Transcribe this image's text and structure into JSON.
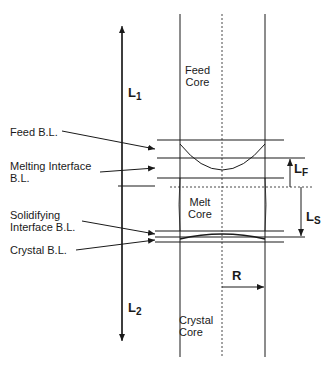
{
  "diagram": {
    "type": "schematic",
    "region_labels": {
      "feed_core": [
        "Feed",
        "Core"
      ],
      "melt_core": [
        "Melt",
        "Core"
      ],
      "crystal_core": [
        "Crystal",
        "Core"
      ]
    },
    "callouts": {
      "feed_bl": "Feed B.L.",
      "melting_interface_bl": [
        "Melting Interface",
        "B.L."
      ],
      "solidifying_interface_bl": [
        "Solidifying",
        "Interface B.L."
      ],
      "crystal_bl": "Crystal B.L."
    },
    "dimensions": {
      "l1": {
        "main": "L",
        "sub": "1"
      },
      "l2": {
        "main": "L",
        "sub": "2"
      },
      "lf": {
        "main": "L",
        "sub": "F"
      },
      "ls": {
        "main": "L",
        "sub": "S"
      },
      "r": "R"
    },
    "colors": {
      "line": "#1a1a1a",
      "background": "#ffffff"
    }
  }
}
